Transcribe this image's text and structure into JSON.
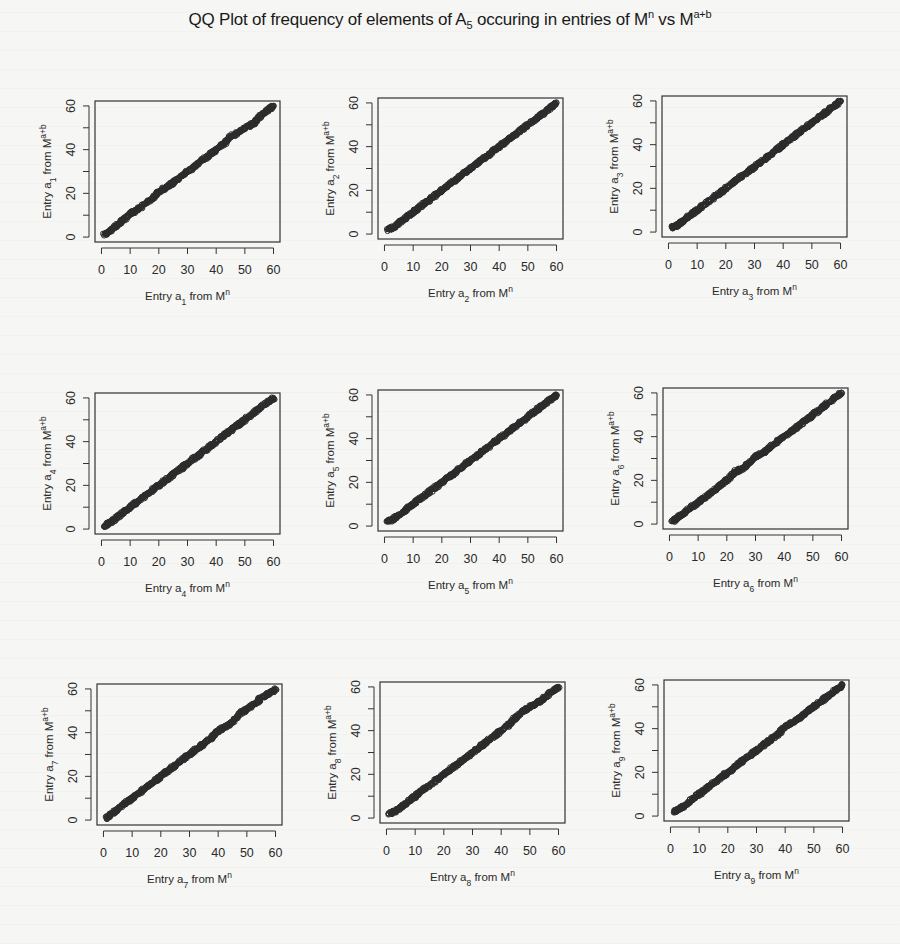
{
  "figure": {
    "title_parts": {
      "pre": "QQ Plot of frequency of elements of A",
      "sub": "5",
      "mid": " occuring in entries of M",
      "sup1": "n",
      "post": " vs M",
      "sup2": "a+b"
    }
  },
  "chart_data": {
    "type": "scatter",
    "layout": {
      "rows": 3,
      "cols": 3,
      "grid": false,
      "legend": "none"
    },
    "panels": [
      {
        "index": 1,
        "xlabel": "Entry a1 from M^n",
        "ylabel": "Entry a1 from M^a+b",
        "xlim": [
          0,
          60
        ],
        "ylim": [
          0,
          60
        ],
        "xticks": [
          0,
          10,
          20,
          30,
          40,
          50,
          60
        ],
        "yticks": [
          0,
          20,
          40,
          60
        ],
        "x": [
          1,
          3,
          5,
          8,
          10,
          12,
          15,
          18,
          20,
          23,
          25,
          28,
          30,
          33,
          35,
          38,
          40,
          43,
          45,
          48,
          50,
          53,
          55,
          58,
          60
        ],
        "y": [
          1,
          3,
          5,
          8,
          11,
          12,
          15,
          18,
          21,
          23,
          25,
          28,
          30,
          33,
          35,
          38,
          40,
          43,
          46,
          48,
          50,
          52,
          55,
          58,
          60
        ]
      },
      {
        "index": 2,
        "xlabel": "Entry a2 from M^n",
        "ylabel": "Entry a2 from M^a+b",
        "xlim": [
          0,
          60
        ],
        "ylim": [
          0,
          60
        ],
        "xticks": [
          0,
          10,
          20,
          30,
          40,
          50,
          60
        ],
        "yticks": [
          0,
          20,
          40,
          60
        ],
        "x": [
          1,
          3,
          5,
          8,
          10,
          12,
          15,
          18,
          20,
          23,
          25,
          28,
          30,
          33,
          35,
          38,
          40,
          43,
          45,
          48,
          50,
          53,
          55,
          58,
          60
        ],
        "y": [
          2,
          3,
          5,
          8,
          10,
          12,
          15,
          18,
          20,
          23,
          25,
          28,
          30,
          33,
          35,
          38,
          40,
          43,
          45,
          48,
          50,
          53,
          55,
          58,
          60
        ]
      },
      {
        "index": 3,
        "xlabel": "Entry a3 from M^n",
        "ylabel": "Entry a3 from M^a+b",
        "xlim": [
          0,
          60
        ],
        "ylim": [
          0,
          60
        ],
        "xticks": [
          0,
          10,
          20,
          30,
          40,
          50,
          60
        ],
        "yticks": [
          0,
          20,
          40,
          60
        ],
        "x": [
          1,
          3,
          5,
          8,
          10,
          12,
          15,
          18,
          20,
          23,
          25,
          28,
          30,
          33,
          35,
          38,
          40,
          43,
          45,
          48,
          50,
          53,
          55,
          58,
          60
        ],
        "y": [
          2,
          3,
          5,
          8,
          10,
          12,
          15,
          18,
          20,
          23,
          25,
          28,
          30,
          33,
          35,
          38,
          40,
          43,
          45,
          48,
          50,
          53,
          55,
          58,
          60
        ]
      },
      {
        "index": 4,
        "xlabel": "Entry a4 from M^n",
        "ylabel": "Entry a4 from M^a+b",
        "xlim": [
          0,
          60
        ],
        "ylim": [
          0,
          60
        ],
        "xticks": [
          0,
          10,
          20,
          30,
          40,
          50,
          60
        ],
        "yticks": [
          0,
          20,
          40,
          60
        ],
        "x": [
          1,
          3,
          5,
          8,
          10,
          12,
          15,
          18,
          20,
          23,
          25,
          28,
          30,
          33,
          35,
          38,
          40,
          43,
          45,
          48,
          50,
          53,
          55,
          58,
          60
        ],
        "y": [
          1,
          3,
          5,
          8,
          10,
          12,
          15,
          18,
          20,
          23,
          25,
          28,
          30,
          33,
          35,
          38,
          40,
          43,
          45,
          48,
          50,
          53,
          55,
          58,
          60
        ]
      },
      {
        "index": 5,
        "xlabel": "Entry a5 from M^n",
        "ylabel": "Entry a5 from M^a+b",
        "xlim": [
          0,
          60
        ],
        "ylim": [
          0,
          60
        ],
        "xticks": [
          0,
          10,
          20,
          30,
          40,
          50,
          60
        ],
        "yticks": [
          0,
          20,
          40,
          60
        ],
        "x": [
          1,
          3,
          5,
          8,
          10,
          12,
          15,
          18,
          20,
          23,
          25,
          28,
          30,
          33,
          35,
          38,
          40,
          43,
          45,
          48,
          50,
          53,
          55,
          58,
          60
        ],
        "y": [
          2,
          3,
          5,
          8,
          10,
          12,
          15,
          18,
          20,
          23,
          25,
          28,
          30,
          33,
          35,
          38,
          40,
          43,
          45,
          48,
          50,
          53,
          55,
          58,
          60
        ]
      },
      {
        "index": 6,
        "xlabel": "Entry a6 from M^n",
        "ylabel": "Entry a6 from M^a+b",
        "xlim": [
          0,
          60
        ],
        "ylim": [
          0,
          60
        ],
        "xticks": [
          0,
          10,
          20,
          30,
          40,
          50,
          60
        ],
        "yticks": [
          0,
          20,
          40,
          60
        ],
        "x": [
          1,
          3,
          5,
          8,
          10,
          12,
          15,
          18,
          20,
          23,
          25,
          28,
          30,
          33,
          35,
          38,
          40,
          43,
          45,
          48,
          50,
          53,
          55,
          58,
          60
        ],
        "y": [
          1,
          3,
          5,
          8,
          10,
          12,
          15,
          18,
          20,
          24,
          25,
          28,
          31,
          33,
          35,
          38,
          40,
          43,
          45,
          48,
          50,
          53,
          55,
          58,
          60
        ]
      },
      {
        "index": 7,
        "xlabel": "Entry a7 from M^n",
        "ylabel": "Entry a7 from M^a+b",
        "xlim": [
          0,
          60
        ],
        "ylim": [
          0,
          60
        ],
        "xticks": [
          0,
          10,
          20,
          30,
          40,
          50,
          60
        ],
        "yticks": [
          0,
          20,
          40,
          60
        ],
        "x": [
          1,
          3,
          5,
          8,
          10,
          12,
          15,
          18,
          20,
          23,
          25,
          28,
          30,
          33,
          35,
          38,
          40,
          43,
          45,
          48,
          50,
          53,
          55,
          58,
          60
        ],
        "y": [
          1,
          3,
          5,
          8,
          10,
          12,
          15,
          18,
          20,
          23,
          25,
          28,
          30,
          33,
          35,
          38,
          41,
          43,
          45,
          49,
          51,
          53,
          56,
          58,
          60
        ]
      },
      {
        "index": 8,
        "xlabel": "Entry a8 from M^n",
        "ylabel": "Entry a8 from M^a+b",
        "xlim": [
          0,
          60
        ],
        "ylim": [
          0,
          60
        ],
        "xticks": [
          0,
          10,
          20,
          30,
          40,
          50,
          60
        ],
        "yticks": [
          0,
          20,
          40,
          60
        ],
        "x": [
          1,
          3,
          5,
          8,
          10,
          12,
          15,
          18,
          20,
          23,
          25,
          28,
          30,
          33,
          35,
          38,
          40,
          43,
          45,
          48,
          50,
          53,
          55,
          58,
          60
        ],
        "y": [
          2,
          3,
          5,
          8,
          10,
          12,
          15,
          18,
          20,
          23,
          25,
          28,
          30,
          33,
          35,
          38,
          40,
          43,
          46,
          49,
          51,
          53,
          55,
          58,
          60
        ]
      },
      {
        "index": 9,
        "xlabel": "Entry a9 from M^n",
        "ylabel": "Entry a9 from M^a+b",
        "xlim": [
          0,
          60
        ],
        "ylim": [
          0,
          60
        ],
        "xticks": [
          0,
          10,
          20,
          30,
          40,
          50,
          60
        ],
        "yticks": [
          0,
          20,
          40,
          60
        ],
        "x": [
          1,
          3,
          5,
          8,
          10,
          12,
          15,
          18,
          20,
          23,
          25,
          28,
          30,
          33,
          35,
          38,
          40,
          43,
          45,
          48,
          50,
          53,
          55,
          58,
          60
        ],
        "y": [
          2,
          3,
          5,
          8,
          10,
          12,
          15,
          18,
          20,
          23,
          25,
          28,
          30,
          33,
          35,
          38,
          41,
          43,
          45,
          48,
          50,
          53,
          55,
          58,
          60
        ]
      }
    ]
  },
  "panel_labels": [
    {
      "xpre": "Entry a",
      "sub": "1",
      "xpost": " from M",
      "xsup": "n",
      "ypre": "Entry a",
      "ypost": " from M",
      "ysup": "a+b"
    },
    {
      "xpre": "Entry a",
      "sub": "2",
      "xpost": " from M",
      "xsup": "n",
      "ypre": "Entry a",
      "ypost": " from M",
      "ysup": "a+b"
    },
    {
      "xpre": "Entry a",
      "sub": "3",
      "xpost": " from M",
      "xsup": "n",
      "ypre": "Entry a",
      "ypost": " from M",
      "ysup": "a+b"
    },
    {
      "xpre": "Entry a",
      "sub": "4",
      "xpost": " from M",
      "xsup": "n",
      "ypre": "Entry a",
      "ypost": " from M",
      "ysup": "a+b"
    },
    {
      "xpre": "Entry a",
      "sub": "5",
      "xpost": " from M",
      "xsup": "n",
      "ypre": "Entry a",
      "ypost": " from M",
      "ysup": "a+b"
    },
    {
      "xpre": "Entry a",
      "sub": "6",
      "xpost": " from M",
      "xsup": "n",
      "ypre": "Entry a",
      "ypost": " from M",
      "ysup": "a+b"
    },
    {
      "xpre": "Entry a",
      "sub": "7",
      "xpost": " from M",
      "xsup": "n",
      "ypre": "Entry a",
      "ypost": " from M",
      "ysup": "a+b"
    },
    {
      "xpre": "Entry a",
      "sub": "8",
      "xpost": " from M",
      "xsup": "n",
      "ypre": "Entry a",
      "ypost": " from M",
      "ysup": "a+b"
    },
    {
      "xpre": "Entry a",
      "sub": "9",
      "xpost": " from M",
      "xsup": "n",
      "ypre": "Entry a",
      "ypost": " from M",
      "ysup": "a+b"
    }
  ],
  "colors": {
    "point": "#2b2b2b",
    "axis": "#333333",
    "background": "#f6f6f4"
  }
}
